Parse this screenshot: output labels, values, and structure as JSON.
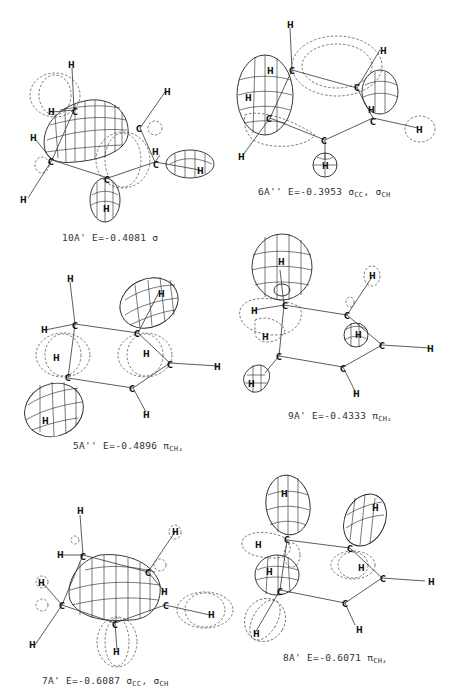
{
  "figure": {
    "panels": [
      {
        "id": "10A'",
        "label": "10A'",
        "energy": "E=-0.4081",
        "character": "σ",
        "character_sub": ""
      },
      {
        "id": "6A''",
        "label": "6A''",
        "energy": "E=-0.3953",
        "character": "σ",
        "character_sub": "CC",
        "character2": "σ",
        "character2_sub": "CH"
      },
      {
        "id": "5A''",
        "label": "5A''",
        "energy": "E=-0.4896",
        "character": "π",
        "character_sub": "CH₂"
      },
      {
        "id": "9A'",
        "label": "9A'",
        "energy": "E=-0.4333",
        "character": "π",
        "character_sub": "CH₂"
      },
      {
        "id": "7A'",
        "label": "7A'",
        "energy": "E=-0.6087",
        "character": "σ",
        "character_sub": "CC",
        "character2": "σ",
        "character2_sub": "CH"
      },
      {
        "id": "8A'",
        "label": "8A'",
        "energy": "E=-0.6071",
        "character": "π",
        "character_sub": "CH₂"
      }
    ],
    "atoms": {
      "carbon": "C",
      "hydrogen": "H"
    }
  }
}
